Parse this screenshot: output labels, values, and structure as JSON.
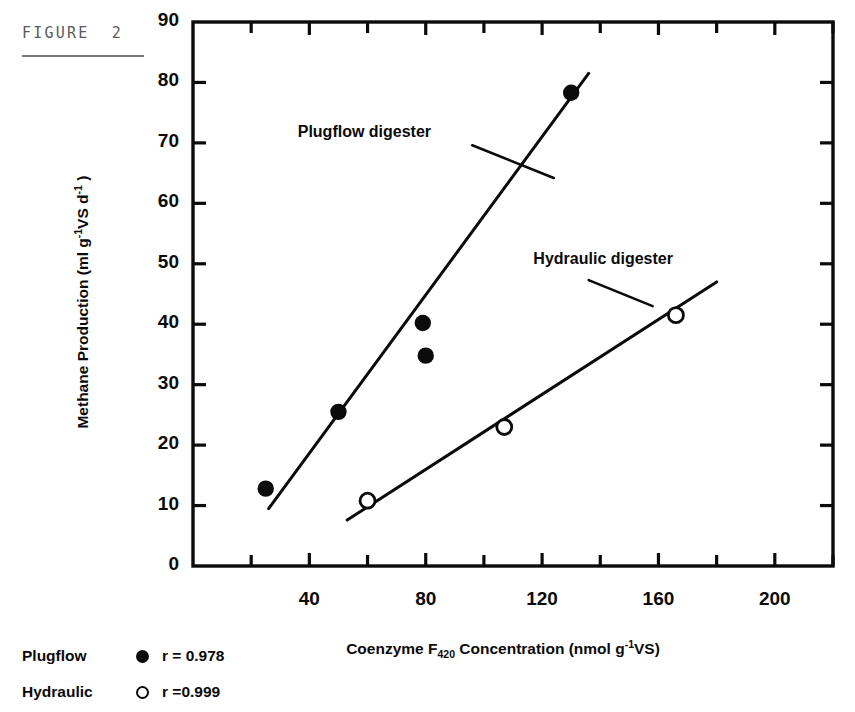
{
  "figure": {
    "caption": "FIGURE  2"
  },
  "chart_data": {
    "type": "scatter",
    "title": "",
    "xlabel_parts": {
      "pre": "Coenzyme F",
      "sub": "420",
      "mid": " Concentration (nmol g",
      "sup": "-1",
      "post": "VS)"
    },
    "ylabel_parts": {
      "pre": "Methane Production (ml g",
      "sup1": "-1",
      "mid": "VS d",
      "sup2": "-1",
      "post": " )"
    },
    "xlabel": "Coenzyme F420 Concentration (nmol g-1VS)",
    "ylabel": "Methane Production (ml g-1VS d-1)",
    "xlim": [
      0,
      220
    ],
    "ylim": [
      0,
      90
    ],
    "x_major_ticks": [
      40,
      80,
      120,
      160,
      200
    ],
    "x_minor_ticks": [
      20,
      60,
      100,
      140,
      180,
      220
    ],
    "x_tick_labels": [
      "40",
      "80",
      "120",
      "160",
      "200"
    ],
    "y_ticks": [
      0,
      10,
      20,
      30,
      40,
      50,
      60,
      70,
      80,
      90
    ],
    "y_tick_labels": [
      "0",
      "10",
      "20",
      "30",
      "40",
      "50",
      "60",
      "70",
      "80",
      "90"
    ],
    "grid": false,
    "frame": "box",
    "tick_direction": "in",
    "legend_position": "below-left",
    "series": [
      {
        "name": "Plugflow",
        "marker": "filled-circle",
        "correlation": "r = 0.978",
        "points": [
          {
            "x": 25,
            "y": 12.8
          },
          {
            "x": 50,
            "y": 25.5
          },
          {
            "x": 79,
            "y": 40.2
          },
          {
            "x": 80,
            "y": 34.8
          },
          {
            "x": 130,
            "y": 78.3
          }
        ],
        "fit_line": {
          "x1": 26,
          "y1": 9.5,
          "x2": 136,
          "y2": 81.5
        }
      },
      {
        "name": "Hydraulic",
        "marker": "open-circle",
        "correlation": "r = 0.999",
        "points": [
          {
            "x": 60,
            "y": 10.8
          },
          {
            "x": 107,
            "y": 23.0
          },
          {
            "x": 166,
            "y": 41.5
          }
        ],
        "fit_line": {
          "x1": 53,
          "y1": 7.6,
          "x2": 180,
          "y2": 47.0
        }
      }
    ],
    "annotations": [
      {
        "text": "Plugflow  digester",
        "label_x": 36,
        "label_y": 71.5,
        "leader": {
          "x1": 96,
          "y1": 69.6,
          "x2": 124,
          "y2": 64.2
        }
      },
      {
        "text": "Hydraulic  digester",
        "label_x": 117,
        "label_y": 50.5,
        "leader": {
          "x1": 136,
          "y1": 47.3,
          "x2": 158,
          "y2": 43.0
        }
      }
    ]
  },
  "legend": {
    "rows": [
      {
        "name": "Plugflow",
        "marker": "filled-circle",
        "r": "r = 0.978"
      },
      {
        "name": "Hydraulic",
        "marker": "open-circle",
        "r": "r =0.999"
      }
    ]
  }
}
